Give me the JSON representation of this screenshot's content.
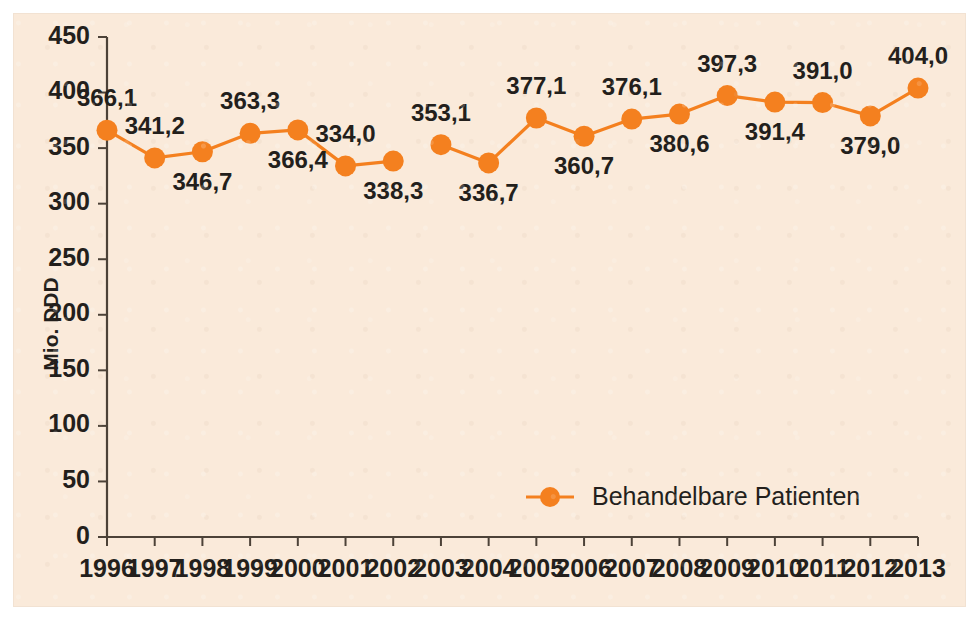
{
  "chart_data": {
    "type": "line",
    "title": "",
    "xlabel": "",
    "ylabel": "Mio. DDD",
    "ylim": [
      0,
      450
    ],
    "ytick_step": 50,
    "yticks": [
      "0",
      "50",
      "100",
      "150",
      "200",
      "250",
      "300",
      "350",
      "400",
      "450"
    ],
    "categories": [
      "1996",
      "1997",
      "1998",
      "1999",
      "2000",
      "2001",
      "2002",
      "2003",
      "2004",
      "2005",
      "2006",
      "2007",
      "2008",
      "2009",
      "2010",
      "2011",
      "2012",
      "2013"
    ],
    "series": [
      {
        "name": "Behandelbare Patienten",
        "color": "#f4801f",
        "values": [
          366.1,
          341.2,
          346.7,
          363.3,
          366.4,
          334.0,
          338.3,
          353.1,
          336.7,
          377.1,
          360.7,
          376.1,
          380.6,
          397.3,
          391.4,
          391.0,
          379.0,
          404.0
        ],
        "labels": [
          "366,1",
          "341,2",
          "346,7",
          "363,3",
          "366,4",
          "334,0",
          "338,3",
          "353,1",
          "336,7",
          "377,1",
          "360,7",
          "376,1",
          "380,6",
          "397,3",
          "391,4",
          "391,0",
          "379,0",
          "404,0"
        ],
        "label_positions": [
          "above",
          "above",
          "below",
          "above",
          "below",
          "above",
          "below",
          "above",
          "below",
          "above",
          "below",
          "above",
          "below",
          "above",
          "below",
          "above",
          "below",
          "above"
        ],
        "line_break_after_index": 6
      }
    ],
    "legend": {
      "position": "bottom-center",
      "entries": [
        {
          "label": "Behandelbare Patienten",
          "color": "#f4801f",
          "marker": "circle"
        }
      ]
    },
    "grid": false,
    "background_color": "#faeada",
    "axis_color": "#4c4238"
  }
}
